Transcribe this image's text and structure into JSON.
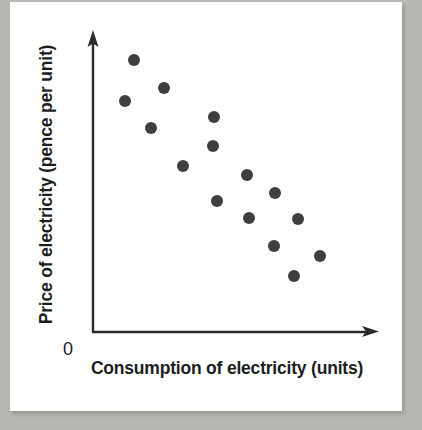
{
  "figure": {
    "background_color": "#b9b7b4",
    "paper_color": "#ffffff",
    "axis_color": "#2b2b2b",
    "point_color": "#3f3f42",
    "origin_label": "0"
  },
  "chart_data": {
    "type": "scatter",
    "title": "",
    "subtitle": "",
    "xlabel": "Consumption of electricity (units)",
    "ylabel": "Price of electricity (pence per unit)",
    "origin_label": "0",
    "grid": false,
    "legend": false,
    "legend_position": "none",
    "axis_style": "arrow-headed L-shaped axes, no tick marks, no tick labels",
    "xlim": [
      0,
      100
    ],
    "ylim": [
      0,
      100
    ],
    "x_tick_labels": [],
    "y_tick_labels": [],
    "annotations": [],
    "relationship": "negative correlation",
    "n_points": 15,
    "points": [
      {
        "x": 14.4,
        "y": 90.6
      },
      {
        "x": 11.2,
        "y": 77.0
      },
      {
        "x": 24.8,
        "y": 81.3
      },
      {
        "x": 20.4,
        "y": 68.0
      },
      {
        "x": 42.5,
        "y": 71.6
      },
      {
        "x": 42.1,
        "y": 62.0
      },
      {
        "x": 31.6,
        "y": 55.2
      },
      {
        "x": 54.0,
        "y": 52.3
      },
      {
        "x": 63.9,
        "y": 46.2
      },
      {
        "x": 43.5,
        "y": 43.7
      },
      {
        "x": 54.7,
        "y": 38.0
      },
      {
        "x": 71.9,
        "y": 37.6
      },
      {
        "x": 63.5,
        "y": 28.6
      },
      {
        "x": 79.6,
        "y": 25.5
      },
      {
        "x": 70.5,
        "y": 18.8
      }
    ]
  },
  "geometry": {
    "axis_origin_px": {
      "x": 93,
      "y": 332
    },
    "y_axis_top_px": 32,
    "x_axis_right_px": 378,
    "point_radius_px": 6
  }
}
